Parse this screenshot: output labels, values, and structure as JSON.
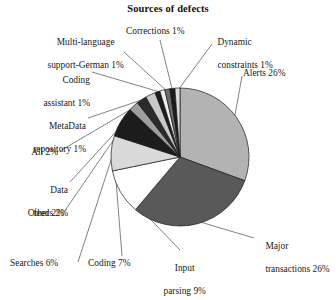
{
  "chart_data": {
    "type": "pie",
    "title": "Sources of defects",
    "xlabel": "",
    "ylabel": "",
    "legend": "none",
    "grid": false,
    "units": "percent",
    "start_angle_deg": 0,
    "direction": "clockwise",
    "categories": [
      "Alerts",
      "Major transactions",
      "Input parsing",
      "Coding",
      "Searches",
      "Other",
      "Data feeds",
      "All",
      "MetaData repository",
      "Coding assistant",
      "Multi-language support-German",
      "Corrections",
      "Dynamic constraints"
    ],
    "values": [
      26,
      26,
      9,
      7,
      6,
      2,
      2,
      2,
      1,
      1,
      1,
      1,
      1
    ],
    "labels": [
      "Alerts 26%",
      "Major transactions 26%",
      "Input parsing 9%",
      "Coding 7%",
      "Searches 6%",
      "Other 2%",
      "Data feeds 2%",
      "All 2%",
      "MetaData repository 1%",
      "Coding assistant 1%",
      "Multi-language support-German 1%",
      "Corrections 1%",
      "Dynamic constraints 1%"
    ],
    "colors": [
      "#b3b3b3",
      "#595959",
      "#ffffff",
      "#d9d9d9",
      "#1c1c1c",
      "#9e9e9e",
      "#2b2b2b",
      "#c9c9c9",
      "#1c1c1c",
      "#efefef",
      "#6b6b6b",
      "#1c1c1c",
      "#dcdcdc"
    ]
  },
  "labels": {
    "title": "Sources of defects",
    "multi_language_line1": "Multi-language",
    "multi_language_line2": "support-German 1%",
    "corrections": "Corrections 1%",
    "dynamic_line1": "Dynamic",
    "dynamic_line2": "constraints 1%",
    "alerts": "Alerts 26%",
    "coding_assistant_line1": "Coding",
    "coding_assistant_line2": "assistant 1%",
    "metadata_line1": "MetaData",
    "metadata_line2": "repository 1%",
    "all": "All 2%",
    "data_feeds_line1": "Data",
    "data_feeds_line2": "feeds 2%",
    "other": "Other 2%",
    "searches": "Searches 6%",
    "coding": "Coding 7%",
    "input_parsing_line1": "Input",
    "input_parsing_line2": "parsing 9%",
    "major_line1": "Major",
    "major_line2": "transactions 26%"
  },
  "style": {
    "stroke": "#1a1a1a",
    "leader_color": "#4d4d4d",
    "background": "#ffffff"
  }
}
